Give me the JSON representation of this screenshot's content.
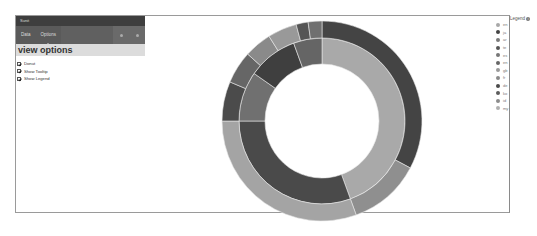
{
  "panel": {
    "title": "Sunit",
    "tabs": [
      {
        "label": "Data"
      },
      {
        "label": "Options"
      }
    ],
    "active_tab": "Options",
    "section_title": "view options",
    "options": [
      {
        "label": "Donut",
        "checked": true
      },
      {
        "label": "Show Tooltip",
        "checked": true
      },
      {
        "label": "Show Legend",
        "checked": true
      }
    ]
  },
  "legend": {
    "title": "Legend",
    "items": [
      {
        "label": "en",
        "color": "#a8a8a8"
      },
      {
        "label": "ja",
        "color": "#444444"
      },
      {
        "label": "ar",
        "color": "#7a7a7a"
      },
      {
        "label": "te",
        "color": "#555555"
      },
      {
        "label": "es",
        "color": "#777777"
      },
      {
        "label": "en",
        "color": "#666666"
      },
      {
        "label": "gb",
        "color": "#9a9a9a"
      },
      {
        "label": "fr",
        "color": "#8a8a8a"
      },
      {
        "label": "de",
        "color": "#4a4a4a"
      },
      {
        "label": "ko",
        "color": "#5c5c5c"
      },
      {
        "label": "id",
        "color": "#8c8c8c"
      },
      {
        "label": "my",
        "color": "#b0b0b0"
      }
    ]
  },
  "chart_data": {
    "type": "sunburst",
    "title": "",
    "center": [
      322,
      121
    ],
    "rings": [
      {
        "name": "inner",
        "r0": 57,
        "r1": 83,
        "segments": [
          {
            "start": 0,
            "end": 160,
            "color": "#a9a9a9"
          },
          {
            "start": 160,
            "end": 270,
            "color": "#4a4a4a"
          },
          {
            "start": 270,
            "end": 305,
            "color": "#707070"
          },
          {
            "start": 305,
            "end": 340,
            "color": "#3f3f3f"
          },
          {
            "start": 340,
            "end": 360,
            "color": "#656565"
          }
        ]
      },
      {
        "name": "outer",
        "r0": 83,
        "r1": 100,
        "segments": [
          {
            "start": 0,
            "end": 118,
            "color": "#444444"
          },
          {
            "start": 118,
            "end": 160,
            "color": "#8f8f8f"
          },
          {
            "start": 160,
            "end": 270,
            "color": "#a4a4a4"
          },
          {
            "start": 270,
            "end": 293,
            "color": "#4b4b4b"
          },
          {
            "start": 293,
            "end": 312,
            "color": "#666666"
          },
          {
            "start": 312,
            "end": 328,
            "color": "#8a8a8a"
          },
          {
            "start": 328,
            "end": 345,
            "color": "#999999"
          },
          {
            "start": 345,
            "end": 352,
            "color": "#555555"
          },
          {
            "start": 352,
            "end": 360,
            "color": "#707070"
          }
        ]
      }
    ],
    "legend_position": "right"
  }
}
